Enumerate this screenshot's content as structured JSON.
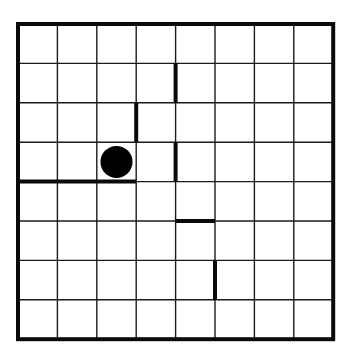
{
  "board": {
    "rows": 8,
    "cols": 8,
    "origin": {
      "x": 18,
      "y": 24
    },
    "cell_size": 39.4,
    "line_color": "#1a1a1a",
    "wall_color": "#0a0a0a",
    "background": "#ffffff",
    "border_width": 4,
    "grid_width": 1.4,
    "wall_width": 4
  },
  "walls": [
    {
      "orientation": "vertical",
      "line": 4,
      "from": 1,
      "to": 2
    },
    {
      "orientation": "vertical",
      "line": 3,
      "from": 2,
      "to": 3
    },
    {
      "orientation": "vertical",
      "line": 4,
      "from": 3,
      "to": 4
    },
    {
      "orientation": "horizontal",
      "line": 4,
      "from": 0,
      "to": 3
    },
    {
      "orientation": "horizontal",
      "line": 5,
      "from": 4,
      "to": 5
    },
    {
      "orientation": "vertical",
      "line": 5,
      "from": 6,
      "to": 7
    }
  ],
  "ball": {
    "col": 2,
    "row": 3,
    "radius": 16,
    "color": "#000000"
  }
}
